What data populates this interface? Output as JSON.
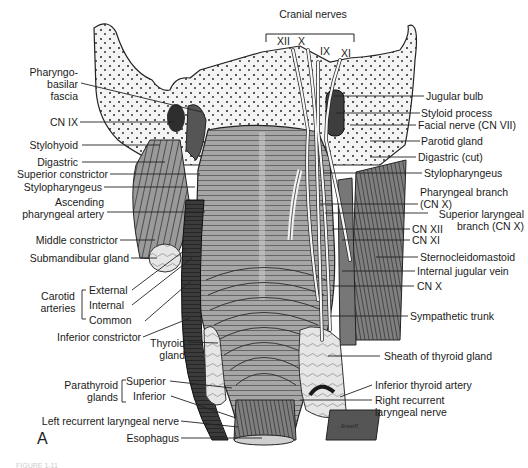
{
  "figure": {
    "panel_letter": "A",
    "signature": "Jewell",
    "caption_fragment": "FIGURE 1-11"
  },
  "top_group": {
    "title": "Cranial nerves",
    "nerves": [
      "XII",
      "X",
      "IX",
      "XI"
    ]
  },
  "left_labels": [
    {
      "id": "pharyngobasilar",
      "lines": [
        "Pharyngo-",
        "basilar",
        "fascia"
      ]
    },
    {
      "id": "cn-ix",
      "text": "CN IX"
    },
    {
      "id": "stylohyoid",
      "text": "Stylohyoid"
    },
    {
      "id": "digastric",
      "text": "Digastric"
    },
    {
      "id": "superior-constrictor",
      "text": "Superior constrictor"
    },
    {
      "id": "stylopharyngeus-left",
      "text": "Stylopharyngeus"
    },
    {
      "id": "ascending-pharyngeal",
      "lines": [
        "Ascending",
        "pharyngeal artery"
      ]
    },
    {
      "id": "middle-constrictor",
      "text": "Middle constrictor"
    },
    {
      "id": "submandibular",
      "text": "Submandibular gland"
    },
    {
      "id": "inferior-constrictor",
      "text": "Inferior constrictor"
    },
    {
      "id": "thyroid-gland",
      "lines": [
        "Thyroid",
        "gland"
      ]
    },
    {
      "id": "left-recurrent",
      "text": "Left recurrent laryngeal nerve"
    },
    {
      "id": "esophagus",
      "text": "Esophagus"
    }
  ],
  "carotid_group": {
    "title_lines": [
      "Carotid",
      "arteries"
    ],
    "items": [
      "External",
      "Internal",
      "Common"
    ]
  },
  "parathyroid_group": {
    "title_lines": [
      "Parathyroid",
      "glands"
    ],
    "items": [
      "Superior",
      "Inferior"
    ]
  },
  "right_labels": [
    {
      "id": "jugular-bulb",
      "text": "Jugular bulb"
    },
    {
      "id": "styloid-process",
      "text": "Styloid process"
    },
    {
      "id": "facial-nerve",
      "text": "Facial nerve (CN VII)"
    },
    {
      "id": "parotid-gland",
      "text": "Parotid gland"
    },
    {
      "id": "digastric-cut",
      "text": "Digastric (cut)"
    },
    {
      "id": "stylopharyngeus-right",
      "text": "Stylopharyngeus"
    },
    {
      "id": "pharyngeal-branch",
      "lines": [
        "Pharyngeal branch",
        "(CN X)"
      ]
    },
    {
      "id": "superior-laryngeal",
      "lines": [
        "Superior laryngeal",
        "branch (CN X)"
      ]
    },
    {
      "id": "cn-xii",
      "text": "CN XII"
    },
    {
      "id": "cn-xi",
      "text": "CN XI"
    },
    {
      "id": "sternocleidomastoid",
      "text": "Sternocleidomastoid"
    },
    {
      "id": "internal-jugular",
      "text": "Internal jugular vein"
    },
    {
      "id": "cn-x",
      "text": "CN X"
    },
    {
      "id": "sympathetic-trunk",
      "text": "Sympathetic trunk"
    },
    {
      "id": "thyroid-sheath",
      "text": "Sheath of thyroid gland"
    },
    {
      "id": "inferior-thyroid-artery",
      "text": "Inferior thyroid artery"
    },
    {
      "id": "right-recurrent",
      "lines": [
        "Right recurrent",
        "laryngeal nerve"
      ]
    }
  ],
  "colors": {
    "ink": "#1a1a1a",
    "muscle": "#8c8c8c",
    "muscle_dark": "#4a4a4a",
    "bone": "#f2f2f2",
    "vessel": "#3a3a3a",
    "nerve": "#f8f8f8",
    "gland": "#d8d8d8"
  }
}
